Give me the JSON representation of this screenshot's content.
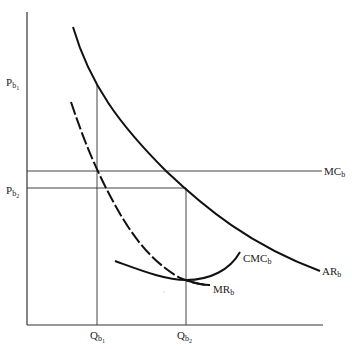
{
  "diagram": {
    "type": "economics-supply-demand",
    "colors": {
      "ink": "#111111",
      "axis": "#333333",
      "guide": "#444444",
      "background": "#ffffff"
    },
    "axes": {
      "y_axis": {
        "x": 27,
        "y_top": 12,
        "y_bottom": 325
      },
      "x_axis": {
        "y": 325,
        "x_left": 27,
        "x_right": 323
      }
    },
    "price_labels": [
      {
        "id": "pb1",
        "main": "P",
        "sub": "b",
        "subsub": "1",
        "y": 83
      },
      {
        "id": "pb2",
        "main": "P",
        "sub": "b",
        "subsub": "2",
        "y": 191
      }
    ],
    "quantity_labels": [
      {
        "id": "qb1",
        "main": "Q",
        "sub": "b",
        "subsub": "1",
        "x": 98
      },
      {
        "id": "qb2",
        "main": "Q",
        "sub": "b",
        "subsub": "2",
        "x": 186
      }
    ],
    "curve_labels": [
      {
        "id": "mc",
        "main": "MC",
        "sub": "b"
      },
      {
        "id": "ar",
        "main": "AR",
        "sub": "b"
      },
      {
        "id": "cmc",
        "main": "CMC",
        "sub": "b"
      },
      {
        "id": "mr",
        "main": "MR",
        "sub": "b"
      }
    ],
    "curves": [
      {
        "id": "AR_b",
        "style": "solid",
        "description": "average revenue / demand curve, downward sloping"
      },
      {
        "id": "MR_b",
        "style": "dashed",
        "description": "marginal revenue, steeper downward sloping"
      },
      {
        "id": "MC_b",
        "style": "solid",
        "description": "horizontal marginal cost line"
      },
      {
        "id": "CMC_b",
        "style": "solid",
        "description": "U-shaped curve near MR minimum"
      }
    ],
    "guides": [
      {
        "id": "pb2-line",
        "from": "P_b2",
        "to": "Q_b2 on AR_b"
      },
      {
        "id": "qb1-line",
        "from": "Q_b1",
        "to": "P_b1 on AR_b"
      },
      {
        "id": "qb2-line",
        "from": "Q_b2",
        "to": "P_b2 on AR_b"
      }
    ]
  }
}
